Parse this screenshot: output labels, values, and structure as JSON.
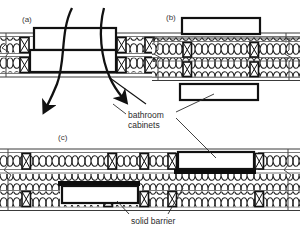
{
  "figure": {
    "background": "#ffffff",
    "ink": "#151515",
    "panels": [
      {
        "id": "a",
        "label": "(a)",
        "caption_x": 22,
        "caption_y": 22,
        "description": "Bathroom cabinets recessed into wall cavity with no barrier; air leaks through.",
        "wall": {
          "x": 0,
          "y": 32,
          "width": 300,
          "height": 46
        },
        "cabinets": [
          {
            "x": 34,
            "y": 28,
            "width": 82,
            "height": 22
          },
          {
            "x": 30,
            "y": 50,
            "width": 86,
            "height": 22
          }
        ],
        "airflow_arrows": 4,
        "has_solid_barrier": false
      },
      {
        "id": "b",
        "label": "(b)",
        "caption_x": 166,
        "caption_y": 20,
        "description": "Bathroom cabinets surface mounted outside the insulated wall cavity.",
        "wall": {
          "x": 150,
          "y": 38,
          "width": 150,
          "height": 42
        },
        "cabinets": [
          {
            "x": 182,
            "y": 18,
            "width": 78,
            "height": 16
          },
          {
            "x": 180,
            "y": 84,
            "width": 78,
            "height": 16
          }
        ],
        "airflow_arrows": 0,
        "has_solid_barrier": false
      },
      {
        "id": "c",
        "label": "(c)",
        "caption_x": 58,
        "caption_y": 140,
        "description": "Bathroom cabinets recessed with solid barrier sealing the wall cavity.",
        "wall": {
          "x": 0,
          "y": 148,
          "width": 300,
          "height": 62
        },
        "cabinets": [
          {
            "x": 178,
            "y": 152,
            "width": 76,
            "height": 17
          },
          {
            "x": 62,
            "y": 186,
            "width": 76,
            "height": 17
          }
        ],
        "barriers": [
          {
            "x": 174,
            "y": 169,
            "width": 82,
            "height": 5
          },
          {
            "x": 58,
            "y": 181,
            "width": 82,
            "height": 5
          }
        ],
        "airflow_arrows": 0,
        "has_solid_barrier": true
      }
    ],
    "annotations": [
      {
        "id": "bathroom-cabinets",
        "text_line_1": "bathroom",
        "text_line_2": "cabinets",
        "x": 128,
        "y": 118,
        "leader_count": 3
      },
      {
        "id": "solid-barrier",
        "text_line_1": "solid barrier",
        "text_line_2": "",
        "x": 131,
        "y": 221,
        "leader_count": 2
      }
    ],
    "symbols": {
      "stud": "stud-cross-section-icon",
      "insulation": "batt-insulation-icon",
      "break_line": "break-line-icon",
      "airflow": "airflow-arrow-icon",
      "barrier": "solid-barrier-icon"
    }
  }
}
